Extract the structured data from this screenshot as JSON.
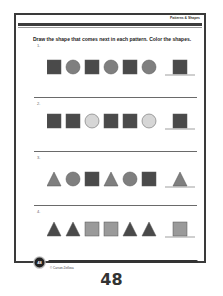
{
  "header": {
    "label": "Patterns & Shapes"
  },
  "instruction": "Draw the shape that comes next in each pattern. Color the shapes.",
  "patterns": [
    {
      "number": "1.",
      "shapes": [
        "square-dark",
        "circle-mid",
        "square-dark",
        "circle-mid",
        "square-dark",
        "circle-mid"
      ],
      "answer": "square-dark"
    },
    {
      "number": "2.",
      "shapes": [
        "square-dark",
        "square-dark",
        "circle-light",
        "square-dark",
        "square-dark",
        "circle-light"
      ],
      "answer": "square-dark"
    },
    {
      "number": "3.",
      "shapes": [
        "triangle-mid",
        "circle-mid",
        "square-dark",
        "triangle-mid",
        "circle-mid",
        "square-dark"
      ],
      "answer": "triangle-mid"
    },
    {
      "number": "4.",
      "shapes": [
        "triangle-dark",
        "triangle-dark",
        "square-light",
        "square-light",
        "triangle-dark",
        "triangle-dark"
      ],
      "answer": "square-light"
    }
  ],
  "colors": {
    "dark": "#4a4a4a",
    "mid": "#7f7f7f",
    "light": "#d6d6d6",
    "square_light": "#9a9a9a",
    "frame": "#3a3a3a"
  },
  "footer": {
    "badge_number": "48",
    "copyright": "© Carson-Dellosa"
  },
  "page_number": "48"
}
